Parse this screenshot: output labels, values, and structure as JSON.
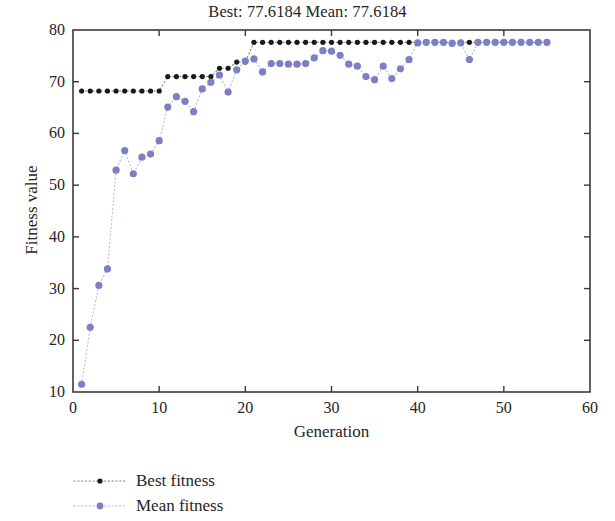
{
  "chart_data": {
    "type": "line",
    "title": "Best: 77.6184 Mean: 77.6184",
    "xlabel": "Generation",
    "ylabel": "Fitness value",
    "xlim": [
      0,
      60
    ],
    "ylim": [
      10,
      80
    ],
    "xticks": [
      0,
      10,
      20,
      30,
      40,
      50,
      60
    ],
    "yticks": [
      10,
      20,
      30,
      40,
      50,
      60,
      70,
      80
    ],
    "grid": false,
    "legend_position": "below-left",
    "best_value": "77.6184",
    "mean_value": "77.6184",
    "series": [
      {
        "name": "Best fitness",
        "color": "#1a1a1a",
        "marker": "dot",
        "linestyle": "dotted",
        "x": [
          1,
          2,
          3,
          4,
          5,
          6,
          7,
          8,
          9,
          10,
          11,
          12,
          13,
          14,
          15,
          16,
          17,
          18,
          19,
          20,
          21,
          22,
          23,
          24,
          25,
          26,
          27,
          28,
          29,
          30,
          31,
          32,
          33,
          34,
          35,
          36,
          37,
          38,
          39,
          40,
          41,
          42,
          43,
          44,
          45,
          46,
          47,
          48,
          49,
          50,
          51,
          52,
          53,
          54,
          55
        ],
        "values": [
          68.2,
          68.2,
          68.2,
          68.2,
          68.2,
          68.2,
          68.2,
          68.2,
          68.2,
          68.2,
          71.0,
          71.0,
          71.0,
          71.0,
          71.0,
          71.0,
          72.6,
          72.6,
          73.8,
          73.8,
          77.6184,
          77.6184,
          77.6184,
          77.6184,
          77.6184,
          77.6184,
          77.6184,
          77.6184,
          77.6184,
          77.6184,
          77.6184,
          77.6184,
          77.6184,
          77.6184,
          77.6184,
          77.6184,
          77.6184,
          77.6184,
          77.6184,
          77.6184,
          77.6184,
          77.6184,
          77.6184,
          77.6184,
          77.6184,
          77.6184,
          77.6184,
          77.6184,
          77.6184,
          77.6184,
          77.6184,
          77.6184,
          77.6184,
          77.6184,
          77.6184
        ]
      },
      {
        "name": "Mean fitness",
        "color": "#7b7fc4",
        "marker": "dot",
        "linestyle": "dotted",
        "x": [
          1,
          2,
          3,
          4,
          5,
          6,
          7,
          8,
          9,
          10,
          11,
          12,
          13,
          14,
          15,
          16,
          17,
          18,
          19,
          20,
          21,
          22,
          23,
          24,
          25,
          26,
          27,
          28,
          29,
          30,
          31,
          32,
          33,
          34,
          35,
          36,
          37,
          38,
          39,
          40,
          41,
          42,
          43,
          44,
          45,
          46,
          47,
          48,
          49,
          50,
          51,
          52,
          53,
          54,
          55
        ],
        "values": [
          11.5,
          22.5,
          30.6,
          33.8,
          52.9,
          56.7,
          52.2,
          55.4,
          56.0,
          58.6,
          65.1,
          67.1,
          66.2,
          64.2,
          68.6,
          69.9,
          71.3,
          68.0,
          72.3,
          74.0,
          74.4,
          71.9,
          73.5,
          73.5,
          73.4,
          73.4,
          73.5,
          74.6,
          76.0,
          75.9,
          75.1,
          73.4,
          73.0,
          71.0,
          70.4,
          73.0,
          70.6,
          72.5,
          74.3,
          77.5,
          77.6184,
          77.6184,
          77.6184,
          77.4,
          77.5,
          74.3,
          77.6184,
          77.6184,
          77.6184,
          77.6184,
          77.6184,
          77.6184,
          77.6184,
          77.6184,
          77.6184
        ]
      }
    ]
  },
  "legend": {
    "items": [
      {
        "label": "Best fitness",
        "color": "#1a1a1a"
      },
      {
        "label": "Mean fitness",
        "color": "#7b7fc4"
      }
    ]
  }
}
